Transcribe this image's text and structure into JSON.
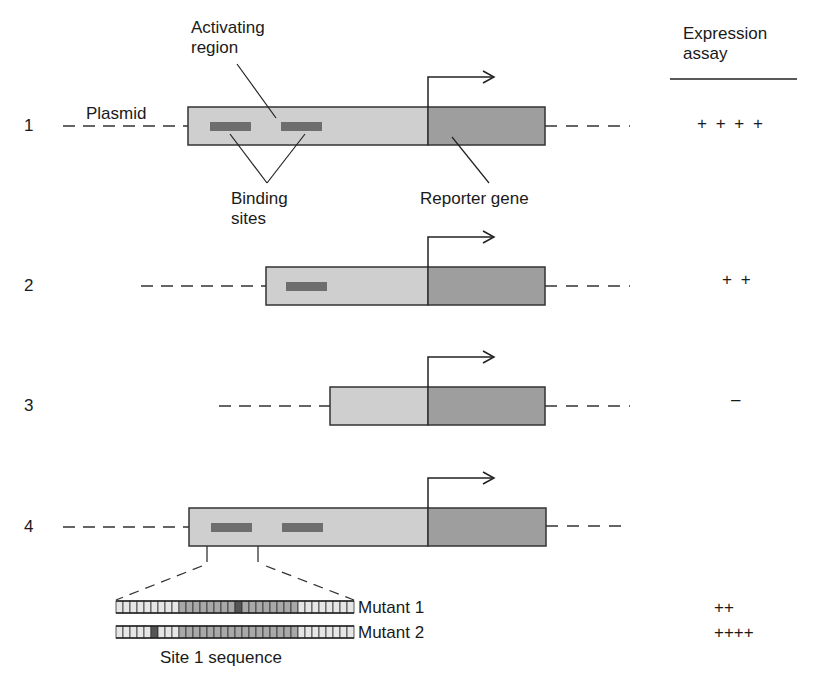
{
  "header": {
    "expression_assay_line1": "Expression",
    "expression_assay_line2": "assay"
  },
  "labels": {
    "activating_region_line1": "Activating",
    "activating_region_line2": "region",
    "plasmid": "Plasmid",
    "binding_sites_line1": "Binding",
    "binding_sites_line2": "sites",
    "reporter_gene": "Reporter gene",
    "site1_sequence": "Site 1 sequence"
  },
  "colors": {
    "activating_region": "#cfcfcf",
    "reporter_gene": "#9e9e9e",
    "binding_site": "#6e6e6e",
    "outline": "#333333"
  },
  "constructs": [
    {
      "number": "1",
      "binding_sites": 2,
      "assay": "+ + + +"
    },
    {
      "number": "2",
      "binding_sites": 1,
      "assay": "+ +"
    },
    {
      "number": "3",
      "binding_sites": 0,
      "assay": "–"
    },
    {
      "number": "4",
      "binding_sites": 2,
      "assay": ""
    }
  ],
  "mutants": [
    {
      "label": "Mutant 1",
      "assay": "++"
    },
    {
      "label": "Mutant 2",
      "assay": "++++"
    }
  ]
}
